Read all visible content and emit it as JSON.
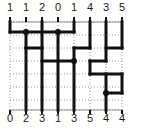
{
  "figure": {
    "type": "grid-path-diagram",
    "width": 142,
    "height": 128,
    "background_color": "#ffffff",
    "path_color": "#111111",
    "grid_color": "#9a9a9a",
    "axis_color": "#8c8c8c",
    "label_color": "#1a1a1a"
  },
  "top_axis": {
    "name": "top-axis",
    "labels": [
      "1",
      "1",
      "2",
      "0",
      "1",
      "4",
      "3",
      "5"
    ],
    "x_positions": [
      10,
      26,
      42,
      58,
      74,
      90,
      106,
      122
    ],
    "y": 2
  },
  "bottom_axis": {
    "name": "bottom-axis",
    "labels": [
      "0",
      "2",
      "3",
      "1",
      "3",
      "5",
      "4",
      "4"
    ],
    "x_positions": [
      10,
      26,
      42,
      58,
      74,
      90,
      106,
      122
    ],
    "y": 113
  },
  "grid": {
    "x_lines": [
      10,
      26,
      42,
      58,
      74,
      90,
      106,
      122
    ],
    "y_lines": [
      22,
      35,
      48,
      61,
      74,
      87,
      100,
      110
    ],
    "dotted": true,
    "dash_pattern": "1,2"
  },
  "axis_rules": {
    "top_rule_y": 22,
    "bottom_rule_y": 110,
    "left_x": 10,
    "right_x": 122
  },
  "path_segments": {
    "horizontal": [
      {
        "y": 32,
        "x1": 10,
        "x2": 74
      },
      {
        "y": 48,
        "x1": 26,
        "x2": 42
      },
      {
        "y": 48,
        "x1": 74,
        "x2": 90
      },
      {
        "y": 48,
        "x1": 106,
        "x2": 122
      },
      {
        "y": 61,
        "x1": 42,
        "x2": 74
      },
      {
        "y": 61,
        "x1": 90,
        "x2": 106
      },
      {
        "y": 74,
        "x1": 90,
        "x2": 122
      },
      {
        "y": 93,
        "x1": 106,
        "x2": 122
      }
    ],
    "vertical": [
      {
        "x": 10,
        "y1": 22,
        "y2": 32
      },
      {
        "x": 26,
        "y1": 32,
        "y2": 48
      },
      {
        "x": 42,
        "y1": 22,
        "y2": 48
      },
      {
        "x": 42,
        "y1": 48,
        "y2": 110
      },
      {
        "x": 58,
        "y1": 32,
        "y2": 110
      },
      {
        "x": 74,
        "y1": 22,
        "y2": 32
      },
      {
        "x": 74,
        "y1": 48,
        "y2": 110
      },
      {
        "x": 90,
        "y1": 22,
        "y2": 48
      },
      {
        "x": 90,
        "y1": 61,
        "y2": 74
      },
      {
        "x": 106,
        "y1": 22,
        "y2": 61
      },
      {
        "x": 106,
        "y1": 74,
        "y2": 110
      },
      {
        "x": 122,
        "y1": 22,
        "y2": 48
      },
      {
        "x": 122,
        "y1": 74,
        "y2": 93
      },
      {
        "x": 26,
        "y1": 48,
        "y2": 110
      }
    ]
  },
  "nodes": [
    {
      "x": 26,
      "y": 32
    },
    {
      "x": 58,
      "y": 32
    },
    {
      "x": 74,
      "y": 61
    },
    {
      "x": 106,
      "y": 93
    }
  ]
}
